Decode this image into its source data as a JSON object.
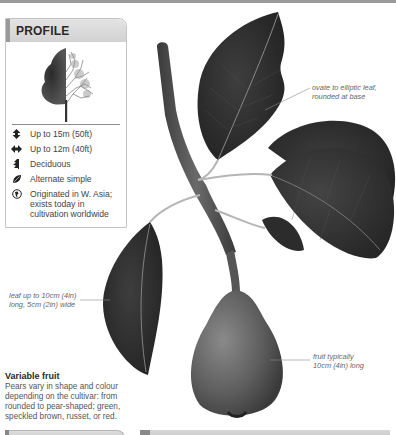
{
  "profile": {
    "title": "PROFILE",
    "facts": [
      {
        "icon": "height-icon",
        "text": "Up to 15m (50ft)"
      },
      {
        "icon": "spread-icon",
        "text": "Up to 12m (40ft)"
      },
      {
        "icon": "deciduous-icon",
        "text": "Deciduous"
      },
      {
        "icon": "leaf-icon",
        "text": "Alternate simple"
      },
      {
        "icon": "origin-globe-icon",
        "text": "Originated in W. Asia;\nexists today in\ncultivation worldwide"
      }
    ]
  },
  "callouts": {
    "leaf_shape": "ovate to elliptic leaf,\nrounded at base",
    "leaf_size": "leaf up to 10cm (4in)\nlong, 5cm (2in) wide",
    "fruit_size": "fruit typically\n10cm (4in) long"
  },
  "variable_fruit": {
    "title": "Variable fruit",
    "body": "Pears vary in shape and colour\ndepending on the cultivar: from\nrounded to pear-shaped; green,\nspeckled brown, russet, or red."
  },
  "colors": {
    "leaf_dark": "#2e2e2e",
    "stem": "#5a5a5a",
    "header_bg": "#d8d8d8",
    "accent_bar": "#9a9a9a"
  }
}
